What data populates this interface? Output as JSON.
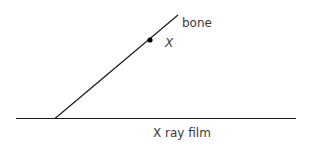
{
  "labels": {
    "bone": "bone",
    "point": "X",
    "film": "X ray film"
  },
  "colors": {
    "line": "#1a1a1a",
    "text": "#3a3a3a"
  }
}
